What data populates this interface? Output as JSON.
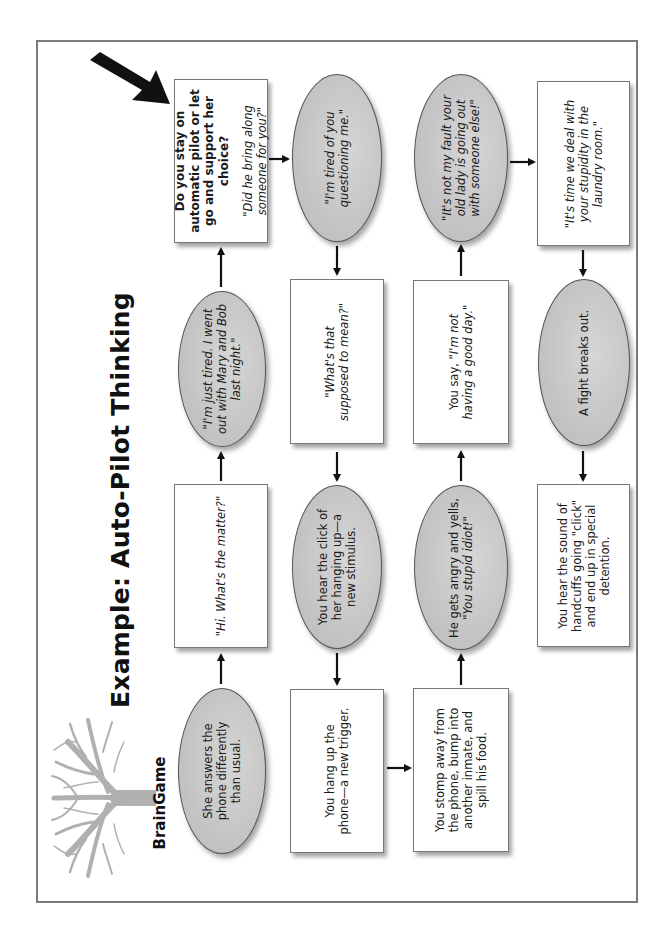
{
  "title": "Example: Auto-Pilot Thinking",
  "brand": "BrainGame",
  "logo_icon": "tree-icon",
  "pointer_icon": "big-black-arrow-icon",
  "colors": {
    "ellipse_fill": "#c9c9c9",
    "box_fill": "#ffffff",
    "border": "#777777",
    "frame": "#7a7a7a",
    "tree": "#b0b0b0",
    "arrow": "#111111"
  },
  "nodes": {
    "n1": {
      "shape": "ellipse",
      "text": "She answers the phone differently than usual."
    },
    "n2": {
      "shape": "box",
      "text": "\"Hi. What's the matter?\""
    },
    "n3": {
      "shape": "ellipse",
      "text": "\"I'm just tired. I went out with Mary and Bob last night.\""
    },
    "n4": {
      "shape": "box",
      "question": "Do you stay on automatic pilot or let go and support her choice?",
      "text": "\"Did he bring along someone for you?\""
    },
    "n5": {
      "shape": "ellipse",
      "text": "\"I'm tired of you questioning me.\""
    },
    "n6": {
      "shape": "box",
      "text": "\"What's that supposed to mean?\""
    },
    "n7": {
      "shape": "ellipse",
      "text": "You hear the click of her hanging up—a new stimulus."
    },
    "n8": {
      "shape": "box",
      "text": "You hang up the phone—a new trigger."
    },
    "n9": {
      "shape": "box",
      "text": "You stomp away from the phone, bump into another inmate, and spill his food."
    },
    "n10": {
      "shape": "ellipse",
      "text_plain": "He gets angry and yells,",
      "text_italic": "\"You stupid idiot!\""
    },
    "n11": {
      "shape": "box",
      "text_plain": "You say,",
      "text_italic": "\"I'm not having a good day.\""
    },
    "n12": {
      "shape": "ellipse",
      "text": "\"It's not my fault your old lady is going out with someone else!\""
    },
    "n13": {
      "shape": "box",
      "text": "\"It's time we deal with your stupidity in the laundry room.\""
    },
    "n14": {
      "shape": "ellipse",
      "text": "A fight breaks out."
    },
    "n15": {
      "shape": "box",
      "text": "You hear the sound of handcuffs going \"click\" and end up in special detention."
    }
  },
  "flow": [
    "n1",
    "n2",
    "n3",
    "n4",
    "n5",
    "n6",
    "n7",
    "n8",
    "n9",
    "n10",
    "n11",
    "n12",
    "n13",
    "n14",
    "n15"
  ]
}
